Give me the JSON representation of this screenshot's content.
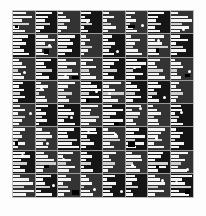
{
  "figure": {
    "title": "",
    "background_color": "#fdfdfd",
    "plot_background_color": "#2b2b2b",
    "bar_color": "#f4f4f4",
    "grid_color": "#9a9a9a",
    "marker_color": "#ffffff",
    "border_color": "#bdbdbd"
  },
  "chart_data": {
    "type": "bar",
    "title": "",
    "subtitle": "",
    "xlabel": "",
    "ylabel": "",
    "grid": true,
    "legend": null,
    "rows": 8,
    "cols": 8,
    "bars_per_cell": 6,
    "value_range": [
      0,
      100
    ],
    "categories": [
      "b1",
      "b2",
      "b3",
      "b4",
      "b5",
      "b6"
    ],
    "panel_shade": [
      [
        0,
        1,
        0,
        1,
        0,
        0,
        1,
        0
      ],
      [
        1,
        0,
        1,
        0,
        1,
        0,
        0,
        1
      ],
      [
        0,
        1,
        0,
        0,
        1,
        1,
        0,
        0
      ],
      [
        1,
        0,
        0,
        1,
        0,
        1,
        1,
        0
      ],
      [
        0,
        1,
        1,
        0,
        1,
        0,
        0,
        1
      ],
      [
        0,
        0,
        1,
        1,
        0,
        1,
        0,
        1
      ],
      [
        1,
        0,
        0,
        1,
        0,
        0,
        1,
        0
      ],
      [
        0,
        1,
        0,
        0,
        1,
        1,
        0,
        1
      ]
    ],
    "markers": [
      [
        0,
        0,
        0,
        1,
        0,
        1,
        0,
        1
      ],
      [
        0,
        1,
        0,
        0,
        1,
        0,
        1,
        0
      ],
      [
        1,
        0,
        1,
        0,
        0,
        1,
        0,
        1
      ],
      [
        0,
        1,
        0,
        1,
        1,
        0,
        1,
        0
      ],
      [
        1,
        0,
        1,
        0,
        0,
        1,
        0,
        1
      ],
      [
        0,
        1,
        0,
        1,
        1,
        0,
        1,
        0
      ],
      [
        1,
        0,
        1,
        0,
        0,
        1,
        0,
        1
      ],
      [
        0,
        1,
        0,
        1,
        1,
        0,
        1,
        1
      ]
    ],
    "cells": [
      [
        {
          "values": [
            62,
            88,
            40,
            75,
            30,
            55
          ]
        },
        {
          "values": [
            95,
            70,
            52,
            84,
            46,
            28
          ]
        },
        {
          "values": [
            38,
            60,
            92,
            44,
            70,
            22
          ]
        },
        {
          "values": [
            80,
            35,
            68,
            90,
            25,
            58
          ]
        },
        {
          "values": [
            48,
            86,
            30,
            62,
            95,
            40
          ]
        },
        {
          "values": [
            72,
            42,
            78,
            34,
            56,
            88
          ]
        },
        {
          "values": [
            90,
            58,
            44,
            72,
            38,
            66
          ]
        },
        {
          "values": [
            34,
            76,
            96,
            50,
            82,
            44
          ]
        }
      ],
      [
        {
          "values": [
            84,
            50,
            72,
            38,
            64,
            92
          ]
        },
        {
          "values": [
            58,
            90,
            44,
            76,
            32,
            60
          ]
        },
        {
          "values": [
            96,
            66,
            84,
            52,
            78,
            40
          ]
        },
        {
          "values": [
            42,
            74,
            36,
            88,
            54,
            30
          ]
        },
        {
          "values": [
            68,
            40,
            92,
            60,
            46,
            82
          ]
        },
        {
          "values": [
            30,
            82,
            54,
            44,
            70,
            96
          ]
        },
        {
          "values": [
            76,
            34,
            66,
            94,
            40,
            52
          ]
        },
        {
          "values": [
            52,
            94,
            28,
            70,
            86,
            36
          ]
        }
      ],
      [
        {
          "values": [
            44,
            70,
            96,
            34,
            62,
            80
          ]
        },
        {
          "values": [
            88,
            46,
            60,
            92,
            38,
            74
          ]
        },
        {
          "values": [
            36,
            84,
            42,
            66,
            94,
            50
          ]
        },
        {
          "values": [
            70,
            32,
            88,
            48,
            56,
            86
          ]
        },
        {
          "values": [
            92,
            62,
            40,
            78,
            30,
            64
          ]
        },
        {
          "values": [
            54,
            96,
            74,
            36,
            82,
            42
          ]
        },
        {
          "values": [
            66,
            38,
            50,
            86,
            60,
            94
          ]
        },
        {
          "values": [
            30,
            72,
            90,
            44,
            48,
            76
          ]
        }
      ],
      [
        {
          "values": [
            78,
            44,
            86,
            56,
            92,
            34
          ]
        },
        {
          "values": [
            40,
            92,
            62,
            30,
            70,
            88
          ]
        },
        {
          "values": [
            94,
            54,
            36,
            82,
            46,
            64
          ]
        },
        {
          "values": [
            48,
            76,
            94,
            40,
            84,
            32
          ]
        },
        {
          "values": [
            86,
            30,
            58,
            96,
            38,
            72
          ]
        },
        {
          "values": [
            34,
            68,
            80,
            52,
            90,
            44
          ]
        },
        {
          "values": [
            72,
            96,
            42,
            64,
            30,
            86
          ]
        },
        {
          "values": [
            60,
            38,
            74,
            88,
            52,
            40
          ]
        }
      ],
      [
        {
          "values": [
            50,
            88,
            34,
            92,
            66,
            42
          ]
        },
        {
          "values": [
            96,
            40,
            76,
            48,
            84,
            30
          ]
        },
        {
          "values": [
            32,
            72,
            90,
            58,
            36,
            94
          ]
        },
        {
          "values": [
            82,
            50,
            44,
            86,
            70,
            38
          ]
        },
        {
          "values": [
            44,
            94,
            62,
            34,
            92,
            76
          ]
        },
        {
          "values": [
            90,
            36,
            80,
            70,
            42,
            58
          ]
        },
        {
          "values": [
            38,
            64,
            96,
            44,
            74,
            86
          ]
        },
        {
          "values": [
            76,
            86,
            30,
            62,
            48,
            92
          ]
        }
      ],
      [
        {
          "values": [
            92,
            56,
            70,
            40,
            88,
            34
          ]
        },
        {
          "values": [
            36,
            80,
            94,
            62,
            44,
            72
          ]
        },
        {
          "values": [
            74,
            42,
            48,
            90,
            66,
            96
          ]
        },
        {
          "values": [
            88,
            94,
            36,
            54,
            78,
            30
          ]
        },
        {
          "values": [
            30,
            66,
            84,
            96,
            40,
            62
          ]
        },
        {
          "values": [
            64,
            38,
            92,
            44,
            86,
            50
          ]
        },
        {
          "values": [
            96,
            72,
            54,
            80,
            32,
            88
          ]
        },
        {
          "values": [
            42,
            90,
            66,
            34,
            94,
            58
          ]
        }
      ],
      [
        {
          "values": [
            66,
            94,
            44,
            82,
            38,
            70
          ]
        },
        {
          "values": [
            40,
            58,
            88,
            96,
            52,
            36
          ]
        },
        {
          "values": [
            86,
            30,
            72,
            48,
            94,
            64
          ]
        },
        {
          "values": [
            52,
            84,
            40,
            76,
            30,
            92
          ]
        },
        {
          "values": [
            94,
            46,
            62,
            88,
            72,
            34
          ]
        },
        {
          "values": [
            38,
            90,
            96,
            42,
            58,
            80
          ]
        },
        {
          "values": [
            70,
            62,
            34,
            94,
            86,
            48
          ]
        },
        {
          "values": [
            96,
            44,
            78,
            56,
            40,
            90
          ]
        }
      ],
      [
        {
          "values": [
            34,
            76,
            92,
            50,
            96,
            62
          ]
        },
        {
          "values": [
            88,
            42,
            56,
            80,
            34,
            94
          ]
        },
        {
          "values": [
            60,
            96,
            38,
            72,
            88,
            46
          ]
        },
        {
          "values": [
            44,
            64,
            86,
            30,
            70,
            96
          ]
        },
        {
          "values": [
            90,
            32,
            94,
            66,
            52,
            78
          ]
        },
        {
          "values": [
            72,
            86,
            48,
            94,
            40,
            58
          ]
        },
        {
          "values": [
            38,
            70,
            96,
            56,
            88,
            42
          ]
        },
        {
          "values": [
            94,
            52,
            66,
            90,
            36,
            80
          ]
        }
      ]
    ]
  }
}
